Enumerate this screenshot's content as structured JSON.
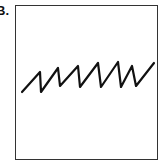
{
  "figure": {
    "label": "B.",
    "stroke_color": "#111111",
    "frame_color": "#333333",
    "waveform_points": [
      [
        22,
        92
      ],
      [
        40,
        72
      ],
      [
        41,
        92
      ],
      [
        58,
        68
      ],
      [
        60,
        86
      ],
      [
        78,
        66
      ],
      [
        80,
        87
      ],
      [
        98,
        63
      ],
      [
        101,
        87
      ],
      [
        118,
        62
      ],
      [
        121,
        87
      ],
      [
        132,
        66
      ],
      [
        136,
        86
      ],
      [
        154,
        63
      ]
    ]
  }
}
